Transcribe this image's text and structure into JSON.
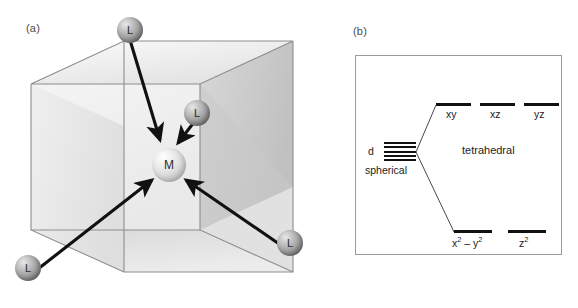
{
  "figure": {
    "panel_a": {
      "label": "(a)",
      "center_atom": "M",
      "ligands": [
        {
          "label": "L",
          "position": "top"
        },
        {
          "label": "L",
          "position": "right-middle"
        },
        {
          "label": "L",
          "position": "bottom-left"
        },
        {
          "label": "L",
          "position": "bottom-right"
        }
      ],
      "shape": "cube",
      "colors": {
        "cube_edge": "#8d8d8d",
        "cube_face_light": "#f0f0f0",
        "cube_face_mid": "#dcdcdc",
        "cube_face_dark": "#c3c3c3",
        "arrow": "#111111"
      }
    },
    "panel_b": {
      "label": "(b)",
      "source_label": "d",
      "source_sublabel": "spherical",
      "field_label": "tetrahedral",
      "upper_levels": [
        {
          "label": "xy"
        },
        {
          "label": "xz"
        },
        {
          "label": "yz"
        }
      ],
      "lower_levels": [
        {
          "label": "x² – y²",
          "base": "x",
          "sup1": "2",
          "mid": " – y",
          "sup2": "2"
        },
        {
          "label": "z²",
          "base": "z",
          "sup1": "2"
        }
      ],
      "degenerate_line_count": 5,
      "colors": {
        "level": "#111111",
        "frame": "#9a9a9a",
        "connector": "#333333"
      }
    }
  }
}
